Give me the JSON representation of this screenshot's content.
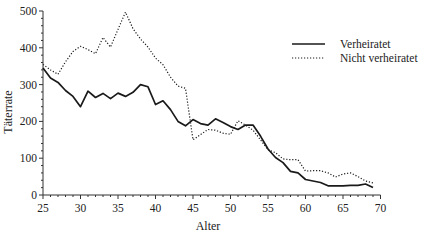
{
  "chart_data": {
    "type": "line",
    "title": "",
    "xlabel": "Alter",
    "ylabel": "Täterrate",
    "xlim": [
      25,
      70
    ],
    "ylim": [
      0,
      500
    ],
    "xticks": [
      25,
      30,
      35,
      40,
      45,
      50,
      55,
      60,
      65,
      70
    ],
    "yticks": [
      0,
      100,
      200,
      300,
      400,
      500
    ],
    "grid": false,
    "legend_position": "upper right",
    "x": [
      25,
      26,
      27,
      28,
      29,
      30,
      31,
      32,
      33,
      34,
      35,
      36,
      37,
      38,
      39,
      40,
      41,
      42,
      43,
      44,
      45,
      46,
      47,
      48,
      49,
      50,
      51,
      52,
      53,
      54,
      55,
      56,
      57,
      58,
      59,
      60,
      61,
      62,
      63,
      64,
      65,
      66,
      67,
      68,
      69
    ],
    "series": [
      {
        "name": "Verheiratet",
        "style": "solid",
        "values": [
          345,
          318,
          306,
          284,
          268,
          240,
          282,
          265,
          276,
          262,
          277,
          268,
          279,
          300,
          294,
          246,
          256,
          232,
          200,
          188,
          205,
          194,
          190,
          207,
          197,
          186,
          178,
          190,
          190,
          160,
          125,
          102,
          88,
          64,
          60,
          42,
          38,
          34,
          25,
          25,
          25,
          26,
          26,
          30,
          20
        ]
      },
      {
        "name": "Nicht verheiratet",
        "style": "dotted",
        "values": [
          355,
          340,
          328,
          362,
          390,
          404,
          395,
          384,
          428,
          402,
          450,
          497,
          452,
          424,
          402,
          372,
          354,
          320,
          296,
          290,
          150,
          164,
          178,
          176,
          168,
          165,
          202,
          190,
          176,
          150,
          123,
          115,
          98,
          96,
          96,
          65,
          66,
          66,
          60,
          49,
          57,
          60,
          50,
          38,
          33
        ]
      }
    ]
  },
  "legend": {
    "items": [
      {
        "label": "Verheiratet",
        "style": "solid"
      },
      {
        "label": "Nicht verheiratet",
        "style": "dotted"
      }
    ]
  },
  "axes": {
    "xlabel": "Alter",
    "ylabel": "Täterrate"
  },
  "colors": {
    "line": "#1a1a1a",
    "axis": "#333333"
  }
}
